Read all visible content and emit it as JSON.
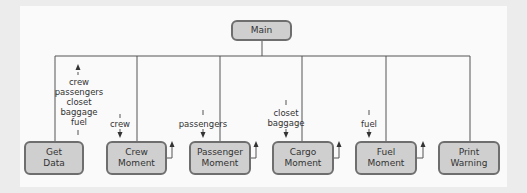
{
  "diagram": {
    "type": "structure-chart",
    "root": {
      "label": "Main"
    },
    "modules": [
      {
        "label": "Get\nData",
        "param_out": "crew\npassengers\ncloset\nbaggage\nfuel"
      },
      {
        "label": "Crew\nMoment",
        "param_in": "crew"
      },
      {
        "label": "Passenger\nMoment",
        "param_in": "passengers"
      },
      {
        "label": "Cargo\nMoment",
        "param_in": "closet\nbaggage"
      },
      {
        "label": "Fuel\nMoment",
        "param_in": "fuel"
      },
      {
        "label": "Print\nWarning"
      }
    ],
    "colors": {
      "box_fill": "#cfcfcf",
      "box_border": "#6e6e6e",
      "line": "#555555",
      "background": "#fafafa"
    }
  }
}
